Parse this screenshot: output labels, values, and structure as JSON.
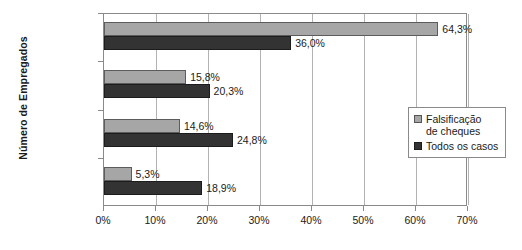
{
  "chart_data": {
    "type": "bar",
    "orientation": "horizontal",
    "title": "",
    "xlabel": "",
    "ylabel": "Número de Empregados",
    "xlim": [
      0,
      70
    ],
    "xtick_labels": [
      "0%",
      "10%",
      "20%",
      "30%",
      "40%",
      "50%",
      "60%",
      "70%"
    ],
    "xtick_values": [
      0,
      10,
      20,
      30,
      40,
      50,
      60,
      70
    ],
    "grid": true,
    "legend_position": "center-right",
    "categories": [
      "1–99",
      "100–999",
      "1.000–9.999",
      "10.000+"
    ],
    "series": [
      {
        "name": "Falsificação de cheques",
        "color": "#a6a6a6",
        "values": [
          64.3,
          15.8,
          14.6,
          5.3
        ],
        "labels": [
          "64,3%",
          "15,8%",
          "14,6%",
          "5,3%"
        ]
      },
      {
        "name": "Todos os casos",
        "color": "#333333",
        "values": [
          36.0,
          20.3,
          24.8,
          18.9
        ],
        "labels": [
          "36,0%",
          "20,3%",
          "24,8%",
          "18,9%"
        ]
      }
    ],
    "legend_entries": [
      "Falsificação\nde cheques",
      "Todos os casos"
    ]
  }
}
